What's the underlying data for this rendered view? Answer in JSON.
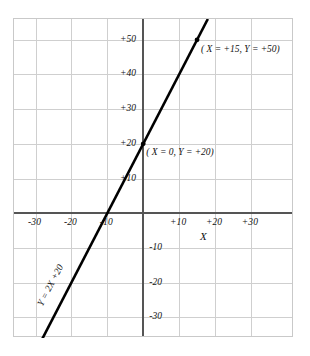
{
  "chart_data": {
    "type": "line",
    "title": "",
    "xlabel": "X",
    "ylabel": "",
    "grid": true,
    "legend": "none",
    "equation": "Y = 2X + 20",
    "slope": 2,
    "intercept": 20,
    "xlim": [
      -36,
      42
    ],
    "ylim": [
      -36,
      56
    ],
    "xticks": [
      -30,
      -20,
      -10,
      10,
      20,
      30
    ],
    "yticks": [
      -30,
      -20,
      -10,
      10,
      20,
      30,
      40,
      50
    ],
    "xtick_labels": [
      "-30",
      "-20",
      "-10",
      "+10",
      "+20",
      "+30"
    ],
    "ytick_labels": [
      "-30",
      "-20",
      "-10",
      "+10",
      "+20",
      "+30",
      "+40",
      "+50"
    ],
    "x": [
      -30,
      18
    ],
    "values": [
      -40,
      56
    ],
    "points": [
      {
        "x": 0,
        "y": 20,
        "label": "( X = 0, Y = +20)"
      },
      {
        "x": 15,
        "y": 50,
        "label": "( X = +15, Y = +50)"
      }
    ],
    "annotations": [
      {
        "name": "point-label-intercept",
        "text": "( X = 0, Y = +20)"
      },
      {
        "name": "point-label-upper",
        "text": "( X = +15, Y = +50)"
      },
      {
        "name": "equation-label",
        "text": "Y = 2X +20"
      }
    ],
    "colors": {
      "line": "#000000",
      "marker": "#000000",
      "axis": "#555555",
      "grid": "#cfcfcf",
      "frame": "#c9c9c9",
      "background": "#ffffff",
      "text": "#111111"
    }
  },
  "axis_title": {
    "x": "X"
  },
  "equation": {
    "text": "Y = 2X +20"
  },
  "point_labels": {
    "upper": "( X = +15, Y = +50)",
    "intercept": "( X = 0, Y = +20)"
  }
}
